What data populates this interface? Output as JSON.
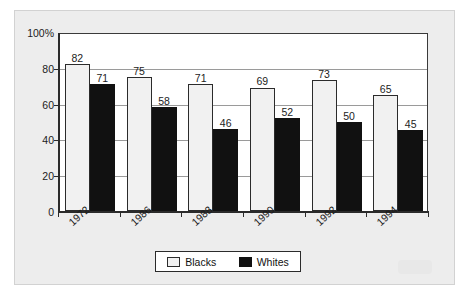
{
  "chart_data": {
    "type": "bar",
    "title": "",
    "subtitle": "",
    "xlabel": "",
    "ylabel": "",
    "categories": [
      "1972",
      "1986",
      "1988",
      "1990",
      "1992",
      "1994"
    ],
    "series": [
      {
        "name": "Blacks",
        "values": [
          82,
          75,
          71,
          69,
          73,
          65
        ],
        "color": "#f1f1f1"
      },
      {
        "name": "Whites",
        "values": [
          71,
          58,
          46,
          52,
          50,
          45
        ],
        "color": "#111111"
      }
    ],
    "ylim": [
      0,
      100
    ],
    "ytick_labels": [
      "100%",
      "80",
      "60",
      "40",
      "20",
      "0"
    ],
    "ytick_values": [
      100,
      80,
      60,
      40,
      20,
      0
    ],
    "grid": true,
    "legend_position": "bottom",
    "value_labels_shown": true,
    "xtick_rotation": -42
  },
  "legend": {
    "entries": [
      {
        "label": "Blacks",
        "swatch": "light-swatch-icon"
      },
      {
        "label": "Whites",
        "swatch": "dark-swatch-icon"
      }
    ]
  }
}
